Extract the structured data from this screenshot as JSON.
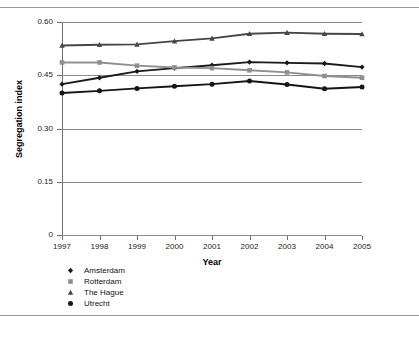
{
  "page": {
    "ghost_text": ". .  .  . .",
    "background": "#ffffff",
    "rule_color": "#9a9a9a"
  },
  "chart_data": {
    "type": "line",
    "title": "",
    "xlabel": "Year",
    "ylabel": "Segregation index",
    "categories": [
      "1997",
      "1998",
      "1999",
      "2000",
      "2001",
      "2002",
      "2003",
      "2004",
      "2005"
    ],
    "x": [
      1997,
      1998,
      1999,
      2000,
      2001,
      2002,
      2003,
      2004,
      2005
    ],
    "xlim": [
      1997,
      2005
    ],
    "ylim": [
      0,
      0.6
    ],
    "yticks": [
      0,
      0.15,
      0.3,
      0.45,
      0.6
    ],
    "ytick_labels": [
      "0",
      "0.15",
      "0.30",
      "0.45",
      "0.60"
    ],
    "grid": true,
    "grid_axis": "y",
    "legend_position": "below-left",
    "series": [
      {
        "name": "Amsterdam",
        "marker": "diamond",
        "color": "#1a1a1a",
        "values": [
          0.425,
          0.443,
          0.461,
          0.47,
          0.478,
          0.487,
          0.485,
          0.483,
          0.473
        ]
      },
      {
        "name": "Rotterdam",
        "marker": "square",
        "color": "#8f8f8f",
        "values": [
          0.486,
          0.486,
          0.477,
          0.472,
          0.47,
          0.464,
          0.458,
          0.448,
          0.443
        ]
      },
      {
        "name": "The Hague",
        "marker": "triangle",
        "color": "#464646",
        "values": [
          0.534,
          0.536,
          0.537,
          0.546,
          0.554,
          0.567,
          0.57,
          0.567,
          0.566
        ]
      },
      {
        "name": "Utrecht",
        "marker": "circle",
        "color": "#151515",
        "values": [
          0.4,
          0.406,
          0.413,
          0.419,
          0.425,
          0.434,
          0.424,
          0.412,
          0.417
        ]
      }
    ]
  }
}
